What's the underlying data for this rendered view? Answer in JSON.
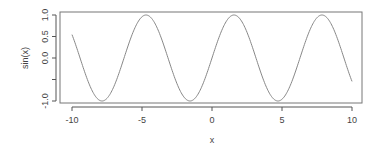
{
  "chart_data": {
    "type": "line",
    "title": "",
    "xlabel": "x",
    "ylabel": "sin(x)",
    "x_ticks": [
      -10,
      -5,
      0,
      5,
      10
    ],
    "x_tick_labels": [
      "-10",
      "-5",
      "0",
      "5",
      "10"
    ],
    "y_ticks": [
      -1.0,
      -0.5,
      0.0,
      0.5,
      1.0
    ],
    "y_tick_labels": [
      "-1.0",
      "",
      "0.0",
      "0.5",
      "1.0"
    ],
    "xlim": [
      -10.8,
      10.8
    ],
    "ylim": [
      -1.0,
      1.0
    ],
    "grid": false,
    "legend": null,
    "series": [
      {
        "name": "sin(x)",
        "function": "sin(x)",
        "x_range": [
          -10,
          10
        ],
        "color": "#888888",
        "x": [
          -10,
          -9,
          -8,
          -7,
          -6,
          -5,
          -4,
          -3,
          -2,
          -1,
          0,
          1,
          2,
          3,
          4,
          5,
          6,
          7,
          8,
          9,
          10
        ],
        "y": [
          0.544,
          -0.412,
          -0.989,
          -0.657,
          0.279,
          0.959,
          0.757,
          -0.141,
          -0.909,
          -0.841,
          0.0,
          0.841,
          0.909,
          0.141,
          -0.757,
          -0.959,
          -0.279,
          0.657,
          0.989,
          0.412,
          -0.544
        ]
      }
    ]
  },
  "colors": {
    "line": "#888888",
    "axis": "#555555",
    "text": "#444444"
  }
}
